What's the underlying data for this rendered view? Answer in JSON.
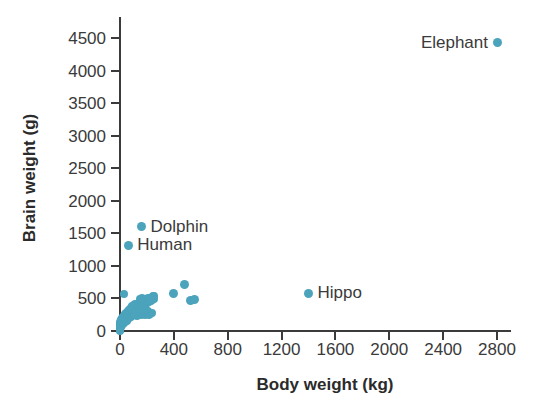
{
  "chart_data": {
    "type": "scatter",
    "title": "",
    "xlabel": "Body weight (kg)",
    "ylabel": "Brain weight (g)",
    "xlim": [
      0,
      2900
    ],
    "ylim": [
      0,
      4600
    ],
    "xticks": [
      0,
      400,
      800,
      1200,
      1600,
      2000,
      2400,
      2800
    ],
    "xtick_labels": [
      "0",
      "400",
      "800",
      "1200",
      "1600",
      "2000",
      "2400",
      "2800"
    ],
    "yticks": [
      0,
      500,
      1000,
      1500,
      2000,
      2500,
      3000,
      3500,
      4000,
      4500
    ],
    "ytick_labels": [
      "0",
      "500",
      "1000",
      "1500",
      "2000",
      "2500",
      "3000",
      "3500",
      "4000",
      "4500"
    ],
    "grid": false,
    "legend": "none",
    "marker_color": "#4ba3bc",
    "text_color": "#3a3a3a",
    "annotations": [
      {
        "label": "Elephant",
        "x": 2800,
        "y": 4430,
        "side": "left"
      },
      {
        "label": "Dolphin",
        "x": 160,
        "y": 1600,
        "side": "right"
      },
      {
        "label": "Human",
        "x": 62,
        "y": 1320,
        "side": "right"
      },
      {
        "label": "Hippo",
        "x": 1400,
        "y": 580,
        "side": "right"
      }
    ],
    "points": [
      {
        "x": 2800,
        "y": 4430
      },
      {
        "x": 160,
        "y": 1600
      },
      {
        "x": 62,
        "y": 1320
      },
      {
        "x": 1400,
        "y": 580
      },
      {
        "x": 400,
        "y": 570
      },
      {
        "x": 480,
        "y": 720
      },
      {
        "x": 520,
        "y": 470
      },
      {
        "x": 555,
        "y": 490
      },
      {
        "x": 30,
        "y": 570
      },
      {
        "x": 250,
        "y": 545
      },
      {
        "x": 245,
        "y": 530
      },
      {
        "x": 255,
        "y": 490
      },
      {
        "x": 230,
        "y": 455
      },
      {
        "x": 215,
        "y": 440
      },
      {
        "x": 200,
        "y": 430
      },
      {
        "x": 190,
        "y": 420
      },
      {
        "x": 185,
        "y": 405
      },
      {
        "x": 175,
        "y": 395
      },
      {
        "x": 170,
        "y": 440
      },
      {
        "x": 165,
        "y": 460
      },
      {
        "x": 160,
        "y": 415
      },
      {
        "x": 155,
        "y": 380
      },
      {
        "x": 150,
        "y": 400
      },
      {
        "x": 148,
        "y": 430
      },
      {
        "x": 145,
        "y": 370
      },
      {
        "x": 140,
        "y": 355
      },
      {
        "x": 138,
        "y": 405
      },
      {
        "x": 135,
        "y": 340
      },
      {
        "x": 132,
        "y": 385
      },
      {
        "x": 128,
        "y": 420
      },
      {
        "x": 125,
        "y": 330
      },
      {
        "x": 122,
        "y": 360
      },
      {
        "x": 120,
        "y": 300
      },
      {
        "x": 118,
        "y": 390
      },
      {
        "x": 115,
        "y": 345
      },
      {
        "x": 112,
        "y": 410
      },
      {
        "x": 110,
        "y": 280
      },
      {
        "x": 108,
        "y": 370
      },
      {
        "x": 105,
        "y": 320
      },
      {
        "x": 102,
        "y": 400
      },
      {
        "x": 100,
        "y": 260
      },
      {
        "x": 98,
        "y": 350
      },
      {
        "x": 95,
        "y": 310
      },
      {
        "x": 92,
        "y": 380
      },
      {
        "x": 90,
        "y": 240
      },
      {
        "x": 88,
        "y": 330
      },
      {
        "x": 85,
        "y": 290
      },
      {
        "x": 82,
        "y": 360
      },
      {
        "x": 80,
        "y": 220
      },
      {
        "x": 78,
        "y": 300
      },
      {
        "x": 75,
        "y": 340
      },
      {
        "x": 72,
        "y": 270
      },
      {
        "x": 70,
        "y": 200
      },
      {
        "x": 68,
        "y": 320
      },
      {
        "x": 65,
        "y": 250
      },
      {
        "x": 62,
        "y": 290
      },
      {
        "x": 60,
        "y": 180
      },
      {
        "x": 58,
        "y": 310
      },
      {
        "x": 55,
        "y": 230
      },
      {
        "x": 52,
        "y": 265
      },
      {
        "x": 50,
        "y": 160
      },
      {
        "x": 48,
        "y": 280
      },
      {
        "x": 45,
        "y": 210
      },
      {
        "x": 42,
        "y": 245
      },
      {
        "x": 40,
        "y": 140
      },
      {
        "x": 38,
        "y": 255
      },
      {
        "x": 35,
        "y": 190
      },
      {
        "x": 32,
        "y": 225
      },
      {
        "x": 30,
        "y": 120
      },
      {
        "x": 28,
        "y": 235
      },
      {
        "x": 26,
        "y": 170
      },
      {
        "x": 24,
        "y": 205
      },
      {
        "x": 22,
        "y": 100
      },
      {
        "x": 20,
        "y": 215
      },
      {
        "x": 18,
        "y": 150
      },
      {
        "x": 16,
        "y": 185
      },
      {
        "x": 14,
        "y": 85
      },
      {
        "x": 12,
        "y": 195
      },
      {
        "x": 11,
        "y": 130
      },
      {
        "x": 10,
        "y": 165
      },
      {
        "x": 9,
        "y": 70
      },
      {
        "x": 8,
        "y": 175
      },
      {
        "x": 7,
        "y": 110
      },
      {
        "x": 6,
        "y": 145
      },
      {
        "x": 5,
        "y": 55
      },
      {
        "x": 5,
        "y": 155
      },
      {
        "x": 4,
        "y": 95
      },
      {
        "x": 4,
        "y": 125
      },
      {
        "x": 3,
        "y": 45
      },
      {
        "x": 3,
        "y": 135
      },
      {
        "x": 2.5,
        "y": 80
      },
      {
        "x": 2,
        "y": 105
      },
      {
        "x": 2,
        "y": 35
      },
      {
        "x": 1.8,
        "y": 115
      },
      {
        "x": 1.5,
        "y": 65
      },
      {
        "x": 1.2,
        "y": 90
      },
      {
        "x": 1,
        "y": 25
      },
      {
        "x": 0.9,
        "y": 75
      },
      {
        "x": 0.7,
        "y": 50
      },
      {
        "x": 0.5,
        "y": 60
      },
      {
        "x": 0.4,
        "y": 15
      },
      {
        "x": 0.3,
        "y": 40
      },
      {
        "x": 0.2,
        "y": 30
      },
      {
        "x": 0.1,
        "y": 20
      },
      {
        "x": 0.05,
        "y": 10
      },
      {
        "x": 0.02,
        "y": 5
      },
      {
        "x": 150,
        "y": 490
      },
      {
        "x": 165,
        "y": 500
      },
      {
        "x": 180,
        "y": 470
      },
      {
        "x": 195,
        "y": 480
      },
      {
        "x": 210,
        "y": 500
      },
      {
        "x": 225,
        "y": 510
      },
      {
        "x": 240,
        "y": 470
      },
      {
        "x": 235,
        "y": 280
      },
      {
        "x": 225,
        "y": 260
      },
      {
        "x": 215,
        "y": 240
      },
      {
        "x": 205,
        "y": 300
      },
      {
        "x": 195,
        "y": 270
      },
      {
        "x": 185,
        "y": 250
      },
      {
        "x": 175,
        "y": 290
      },
      {
        "x": 165,
        "y": 265
      },
      {
        "x": 155,
        "y": 245
      },
      {
        "x": 145,
        "y": 275
      },
      {
        "x": 135,
        "y": 255
      },
      {
        "x": 125,
        "y": 235
      },
      {
        "x": 115,
        "y": 265
      }
    ]
  }
}
